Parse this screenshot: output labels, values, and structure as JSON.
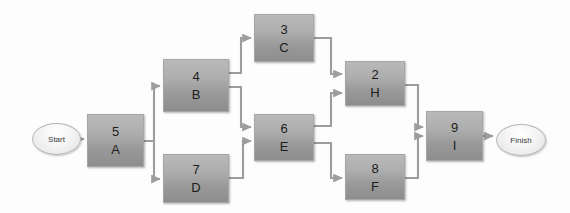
{
  "diagram": {
    "type": "activity-on-node-network",
    "colors": {
      "node_fill_top": "#b9b9b9",
      "node_fill_bottom": "#8d8d8d",
      "node_border": "#a6a6a6",
      "terminator_fill": "#f4f4f4",
      "terminator_border": "#b8b8b8",
      "connector": "#9d9d9d",
      "text": "#1d1d1d",
      "background": "#fdfdfd"
    },
    "terminators": [
      {
        "id": "start",
        "label": "Start",
        "x": 32,
        "y": 123,
        "w": 49,
        "h": 32
      },
      {
        "id": "finish",
        "label": "Finish",
        "x": 496,
        "y": 124,
        "w": 50,
        "h": 32
      }
    ],
    "nodes": [
      {
        "id": "A",
        "duration": "5",
        "code": "A",
        "x": 87,
        "y": 114,
        "w": 57,
        "h": 53
      },
      {
        "id": "B",
        "duration": "4",
        "code": "B",
        "x": 163,
        "y": 59,
        "w": 66,
        "h": 53
      },
      {
        "id": "C",
        "duration": "3",
        "code": "C",
        "x": 254,
        "y": 14,
        "w": 60,
        "h": 48
      },
      {
        "id": "D",
        "duration": "7",
        "code": "D",
        "x": 163,
        "y": 154,
        "w": 66,
        "h": 49
      },
      {
        "id": "E",
        "duration": "6",
        "code": "E",
        "x": 254,
        "y": 114,
        "w": 60,
        "h": 47
      },
      {
        "id": "H",
        "duration": "2",
        "code": "H",
        "x": 345,
        "y": 61,
        "w": 60,
        "h": 45
      },
      {
        "id": "F",
        "duration": "8",
        "code": "F",
        "x": 345,
        "y": 154,
        "w": 60,
        "h": 46
      },
      {
        "id": "I",
        "duration": "9",
        "code": "I",
        "x": 426,
        "y": 111,
        "w": 57,
        "h": 50
      }
    ],
    "edges": [
      {
        "from": "start",
        "to": "A"
      },
      {
        "from": "A",
        "to": "B"
      },
      {
        "from": "A",
        "to": "D"
      },
      {
        "from": "B",
        "to": "C"
      },
      {
        "from": "B",
        "to": "E"
      },
      {
        "from": "D",
        "to": "E"
      },
      {
        "from": "C",
        "to": "H"
      },
      {
        "from": "E",
        "to": "H"
      },
      {
        "from": "E",
        "to": "F"
      },
      {
        "from": "H",
        "to": "I"
      },
      {
        "from": "F",
        "to": "I"
      },
      {
        "from": "I",
        "to": "finish"
      }
    ]
  }
}
